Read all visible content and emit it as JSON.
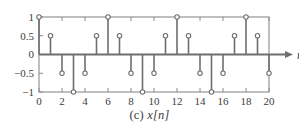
{
  "figure": {
    "caption_label": "(c)",
    "caption_variable": "x[n]",
    "axis_name": "n"
  },
  "style": {
    "line_color": "#6e6e6e",
    "frame_color": "#8a8a8a",
    "marker_fill": "#ffffff",
    "text_color": "#3c3c3c",
    "background": "#ffffff"
  },
  "chart_data": {
    "type": "scatter",
    "plot_style": "stem",
    "title": "(c) x[n]",
    "xlabel": "n",
    "ylabel": "",
    "xlim": [
      0,
      20
    ],
    "ylim": [
      -1,
      1
    ],
    "grid": false,
    "legend": "none",
    "xticks": [
      0,
      2,
      4,
      6,
      8,
      10,
      12,
      14,
      16,
      18,
      20
    ],
    "xtick_labels": [
      "0",
      "2",
      "4",
      "6",
      "8",
      "10",
      "12",
      "14",
      "16",
      "18",
      "20"
    ],
    "yticks": [
      1,
      0.5,
      0,
      -0.5,
      -1
    ],
    "ytick_labels": [
      "1",
      "0.5",
      "0",
      "−0.5",
      "−1"
    ],
    "x": [
      0,
      1,
      2,
      3,
      4,
      5,
      6,
      7,
      8,
      9,
      10,
      11,
      12,
      13,
      14,
      15,
      16,
      17,
      18,
      19,
      20
    ],
    "values": [
      1,
      0.5,
      -0.5,
      -1,
      -0.5,
      0.5,
      1,
      0.5,
      -0.5,
      -1,
      -0.5,
      0.5,
      1,
      0.5,
      -0.5,
      -1,
      -0.5,
      0.5,
      1,
      0.5,
      -0.5
    ],
    "period": 6
  }
}
